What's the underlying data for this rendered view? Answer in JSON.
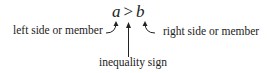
{
  "expression": {
    "left": "a",
    "operator": ">",
    "right": "b"
  },
  "labels": {
    "left": "left side or member",
    "right": "right side or member",
    "bottom": "inequality sign"
  },
  "colors": {
    "text": "#222222",
    "arrow": "#222222",
    "background": "#ffffff"
  }
}
